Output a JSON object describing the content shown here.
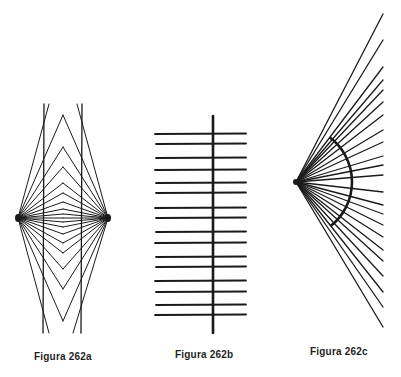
{
  "figures": [
    {
      "id": "a",
      "caption": "Figura 262a",
      "description": "Two fan vertices connected by converging line pairs forming nested chevrons, crossed by two parallel vertical lines",
      "left_vertex": [
        18,
        218
      ],
      "right_vertex": [
        108,
        218
      ],
      "center_x": 63,
      "center_y": 218,
      "chevron_offsets": [
        0,
        4,
        9,
        16,
        25,
        35,
        51,
        71,
        103
      ],
      "verticals": [
        [
          44,
          104,
          43,
          333
        ],
        [
          82,
          104,
          81,
          333
        ]
      ],
      "outer_diagonals": [
        [
          18,
          218,
          49,
          104
        ],
        [
          108,
          218,
          77,
          104
        ],
        [
          18,
          218,
          49,
          333
        ],
        [
          108,
          218,
          73,
          333
        ]
      ]
    },
    {
      "id": "b",
      "caption": "Figura 262b",
      "description": "Pairs of parallel horizontal lines crossed by a single thick vertical line",
      "vertical": [
        213,
        116,
        213,
        333
      ],
      "x_left": 155,
      "x_right": 246,
      "rows_y": [
        134,
        144,
        158,
        170,
        183,
        193,
        208,
        218,
        232,
        243,
        257,
        267,
        281,
        292,
        305,
        315
      ]
    },
    {
      "id": "c",
      "caption": "Figura 262c",
      "description": "Fan of straight rays from a single apex with a thick circular arc crossing them",
      "apex": [
        296,
        182
      ],
      "ray_end_x": 383,
      "ray_end_y": [
        14,
        40,
        67,
        80,
        90,
        102,
        115,
        130,
        142,
        156,
        165,
        175,
        192,
        205,
        214,
        225,
        237,
        250,
        261,
        276,
        292,
        307,
        327
      ],
      "arc": {
        "cx": 296,
        "cy": 182,
        "r": 56,
        "start_deg": -53,
        "end_deg": 52
      }
    }
  ],
  "colors": {
    "ink": "#1a1a1a",
    "background": "#ffffff"
  }
}
